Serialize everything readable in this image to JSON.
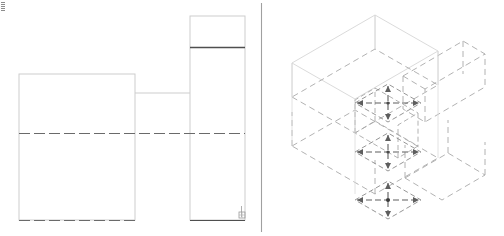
{
  "document": {
    "title": "Technical Drawing",
    "background_color": "#ffffff",
    "width": 504,
    "height": 236
  },
  "palette": {
    "hairline": "#c9c9c9",
    "light": "#b8b8b8",
    "faint": "#dcdcdc",
    "medium": "#8d8d8d",
    "dark": "#4a4a4a",
    "darkest": "#3a3a3a"
  },
  "orthographic_view": {
    "label": "Orthographic Views",
    "divider": {
      "x": 261,
      "y1": 3,
      "y2": 232,
      "color": "#a6a6a6"
    },
    "front_rect": {
      "x": 19,
      "y": 74,
      "w": 116,
      "h": 146,
      "color": "#cfcfcf"
    },
    "front_centerline": {
      "x1": 19,
      "y1": 133,
      "x2": 245,
      "y2": 133,
      "color": "#6f6f6f"
    },
    "front_bottom_dashed": {
      "x1": 19,
      "y1": 220,
      "x2": 135,
      "y2": 220,
      "color": "#6f6f6f"
    },
    "side_rect": {
      "x": 190,
      "y": 16,
      "w": 55,
      "h": 204,
      "color": "#cfcfcf"
    },
    "side_top_line": {
      "x1": 190,
      "y1": 47,
      "x2": 245,
      "y2": 47,
      "color": "#4a4a4a"
    },
    "link_line": {
      "x1": 135,
      "y1": 93,
      "x2": 190,
      "y2": 93,
      "color": "#cfcfcf"
    },
    "side_bottom_line": {
      "x1": 190,
      "y1": 220,
      "x2": 245,
      "y2": 220,
      "color": "#4a4a4a"
    },
    "datum_symbol": {
      "x": 237,
      "y": 207,
      "w": 9,
      "h": 11,
      "color": "#9a9a9a"
    }
  },
  "isometric_view": {
    "label": "Isometric Assembly View",
    "origin": {
      "x": 380,
      "y": 118
    },
    "solid_color": "#d2d2d2",
    "dashed_color": "#a0a0a0",
    "arrow_color": "#5a5a5a",
    "boxes": [
      {
        "name": "upper-left-box",
        "style": "solid"
      },
      {
        "name": "upper-right-box",
        "style": "dashed"
      },
      {
        "name": "lower-left-box",
        "style": "dashed"
      },
      {
        "name": "lower-right-box",
        "style": "dashed"
      },
      {
        "name": "small-center-box",
        "style": "dashed"
      }
    ],
    "arrow_crosses": [
      {
        "name": "arrow-cross-upper",
        "cx": 388,
        "cy": 103,
        "size": 30
      },
      {
        "name": "arrow-cross-middle",
        "cx": 388,
        "cy": 152,
        "size": 30
      },
      {
        "name": "arrow-cross-lower",
        "cx": 388,
        "cy": 200,
        "size": 30
      }
    ]
  }
}
